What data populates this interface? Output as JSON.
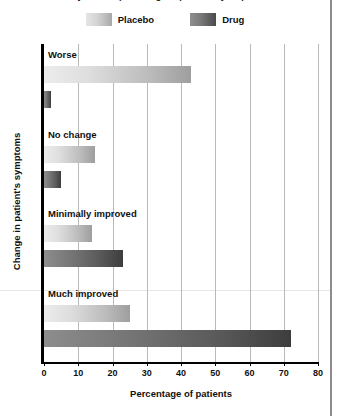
{
  "figure": {
    "clipped_title": "Study results: percentage of patients by response"
  },
  "legend": {
    "position": "top-center",
    "items": [
      {
        "label": "Placebo",
        "swatch": "placebo-swatch",
        "color": "#d2d2d2"
      },
      {
        "label": "Drug",
        "swatch": "drug-swatch",
        "color": "#5a5a5a"
      }
    ]
  },
  "axes": {
    "x": {
      "label": "Percentage of patients",
      "ticks": [
        "0",
        "10",
        "20",
        "30",
        "40",
        "50",
        "60",
        "70",
        "80"
      ],
      "min": 0,
      "max": 80
    },
    "y": {
      "label": "Change in patient's symptoms"
    }
  },
  "groups": [
    {
      "label": "Worse",
      "placebo": 43,
      "drug": 2
    },
    {
      "label": "No change",
      "placebo": 15,
      "drug": 5
    },
    {
      "label": "Minimally improved",
      "placebo": 14,
      "drug": 23
    },
    {
      "label": "Much improved",
      "placebo": 25,
      "drug": 72
    }
  ],
  "chart_data": {
    "type": "bar",
    "orientation": "horizontal",
    "title": "Study results: percentage of patients by response",
    "xlabel": "Percentage of patients",
    "ylabel": "Change in patient's symptoms",
    "categories": [
      "Worse",
      "No change",
      "Minimally improved",
      "Much improved"
    ],
    "series": [
      {
        "name": "Placebo",
        "values": [
          43,
          15,
          14,
          25
        ],
        "color": "#d2d2d2"
      },
      {
        "name": "Drug",
        "values": [
          2,
          5,
          23,
          72
        ],
        "color": "#5a5a5a"
      }
    ],
    "xlim": [
      0,
      80
    ],
    "xticks": [
      0,
      10,
      20,
      30,
      40,
      50,
      60,
      70,
      80
    ],
    "grid": "vertical-only",
    "legend_position": "top-center"
  }
}
